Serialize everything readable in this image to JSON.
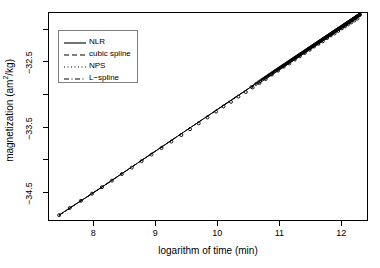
{
  "chart_data": {
    "type": "line",
    "title": "",
    "xlabel": "logarithm of time (min)",
    "ylabel_prefix": "magnetization (am",
    "ylabel_sup": "2",
    "ylabel_suffix": "/kg)",
    "ylabel_plain": "magnetization (am2/kg)",
    "xlim": [
      7.27,
      12.43
    ],
    "ylim": [
      -34.95,
      -31.74
    ],
    "xticks": [
      8,
      9,
      10,
      11,
      12
    ],
    "xtick_labels": [
      "8",
      "9",
      "10",
      "11",
      "12"
    ],
    "yticks": [
      -32.5,
      -33.5,
      -34.5
    ],
    "ytick_labels": [
      "-32.5",
      "-33.5",
      "-34.5"
    ],
    "yticks_minor": [
      -32.0,
      -33.0,
      -34.0
    ],
    "grid": false,
    "legend_position": "top-left",
    "legend": [
      {
        "label": "NLR",
        "style": "solid",
        "key": "line-solid"
      },
      {
        "label": "cubic spline",
        "style": "dashed",
        "key": "line-dashed"
      },
      {
        "label": "NPS",
        "style": "dotted",
        "key": "line-dotted"
      },
      {
        "label": "L-spline",
        "style": "dashdot",
        "key": "line-dashdot"
      }
    ],
    "series": [
      {
        "name": "NLR",
        "style": "solid",
        "x": [
          7.45,
          7.7,
          7.95,
          8.2,
          8.45,
          8.7,
          8.95,
          9.2,
          9.45,
          9.7,
          9.95,
          10.2,
          10.45,
          10.7,
          10.95,
          11.2,
          11.45,
          11.7,
          11.95,
          12.2,
          12.3
        ],
        "y": [
          -34.86,
          -34.7,
          -34.55,
          -34.39,
          -34.23,
          -34.07,
          -33.91,
          -33.75,
          -33.59,
          -33.43,
          -33.27,
          -33.11,
          -32.95,
          -32.79,
          -32.63,
          -32.47,
          -32.31,
          -32.15,
          -31.99,
          -31.84,
          -31.78
        ]
      },
      {
        "name": "cubic spline",
        "style": "dashed",
        "x": [
          7.45,
          8.2,
          8.95,
          9.7,
          10.45,
          11.2,
          11.95,
          12.3
        ],
        "y": [
          -34.86,
          -34.39,
          -33.91,
          -33.43,
          -32.95,
          -32.47,
          -31.99,
          -31.78
        ]
      },
      {
        "name": "NPS",
        "style": "dotted",
        "x": [
          7.45,
          8.2,
          8.95,
          9.7,
          10.45,
          11.2,
          11.95,
          12.3
        ],
        "y": [
          -34.86,
          -34.39,
          -33.91,
          -33.43,
          -32.95,
          -32.47,
          -31.99,
          -31.78
        ]
      },
      {
        "name": "L-spline",
        "style": "dashdot",
        "x": [
          7.45,
          8.2,
          8.95,
          9.7,
          10.45,
          11.2,
          11.95,
          12.3
        ],
        "y": [
          -34.86,
          -34.39,
          -33.91,
          -33.43,
          -32.95,
          -32.47,
          -31.99,
          -31.78
        ]
      }
    ],
    "observed_points": {
      "name": "observed data",
      "marker": "circle",
      "x": [
        7.45,
        7.62,
        7.8,
        7.98,
        8.14,
        8.3,
        8.46,
        8.62,
        8.78,
        8.94,
        9.1,
        9.26,
        9.42,
        9.56,
        9.7,
        9.84,
        9.98,
        10.1,
        10.22,
        10.34,
        10.46,
        10.57,
        10.68,
        10.78,
        10.88,
        10.98,
        11.07,
        11.16,
        11.25,
        11.33,
        11.41,
        11.49,
        11.56,
        11.63,
        11.7,
        11.77,
        11.83,
        11.89,
        11.95,
        12.01,
        12.06,
        12.11,
        12.16,
        12.21,
        12.26,
        12.3
      ],
      "y": [
        -34.86,
        -34.75,
        -34.64,
        -34.53,
        -34.43,
        -34.33,
        -34.23,
        -34.13,
        -34.03,
        -33.93,
        -33.83,
        -33.73,
        -33.63,
        -33.54,
        -33.45,
        -33.36,
        -33.27,
        -33.19,
        -33.12,
        -33.04,
        -32.97,
        -32.9,
        -32.83,
        -32.77,
        -32.7,
        -32.64,
        -32.58,
        -32.53,
        -32.47,
        -32.42,
        -32.37,
        -32.32,
        -32.27,
        -32.23,
        -32.19,
        -32.14,
        -32.1,
        -32.07,
        -32.03,
        -31.99,
        -31.96,
        -31.93,
        -31.9,
        -31.87,
        -31.84,
        -31.78
      ]
    },
    "colors": {
      "line": "#000000",
      "frame": "#000000",
      "legend_border": "#808080",
      "background": "#ffffff"
    }
  }
}
